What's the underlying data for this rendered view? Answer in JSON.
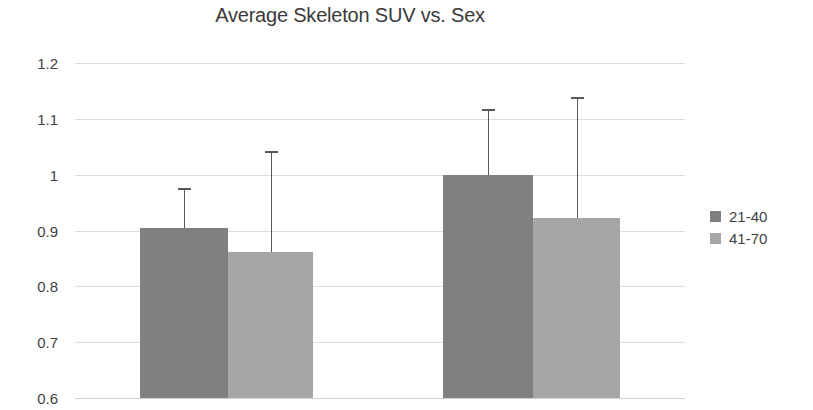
{
  "chart_data": {
    "type": "bar",
    "title": "Average Skeleton SUV vs. Sex",
    "xlabel": "",
    "ylabel": "",
    "ylim": [
      0.6,
      1.2
    ],
    "yticks": [
      "0.6",
      "0.7",
      "0.8",
      "0.9",
      "1",
      "1.1",
      "1.2"
    ],
    "ytick_values": [
      0.6,
      0.7,
      0.8,
      0.9,
      1.0,
      1.1,
      1.2
    ],
    "grid": true,
    "legend_position": "right",
    "categories": [
      "Group 1",
      "Group 2"
    ],
    "series": [
      {
        "name": "21-40",
        "color": "#808080",
        "values": [
          0.905,
          1.0
        ],
        "errors_upper": [
          0.977,
          1.118
        ]
      },
      {
        "name": "41-70",
        "color": "#a6a6a6",
        "values": [
          0.862,
          0.923
        ],
        "errors_upper": [
          1.042,
          1.14
        ]
      }
    ],
    "colors": {
      "gridline": "#dcdcdc",
      "text": "#3f3f3f",
      "title": "#3a3a3a",
      "errorbar": "#595959",
      "background": "#ffffff"
    }
  },
  "legend": {
    "items": [
      {
        "label": "21-40"
      },
      {
        "label": "41-70"
      }
    ]
  }
}
